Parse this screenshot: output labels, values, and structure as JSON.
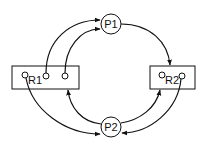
{
  "diagram": {
    "type": "resource-allocation-graph",
    "processes": [
      {
        "id": "P1",
        "label": "P1",
        "cx": 111,
        "cy": 24,
        "r": 10
      },
      {
        "id": "P2",
        "label": "P2",
        "cx": 111,
        "cy": 127,
        "r": 10
      }
    ],
    "resources": [
      {
        "id": "R1",
        "label": "R1",
        "x": 12,
        "y": 66,
        "w": 67,
        "h": 23,
        "instances": 3
      },
      {
        "id": "R2",
        "label": "R2",
        "x": 150,
        "y": 66,
        "w": 45,
        "h": 23,
        "instances": 2
      }
    ],
    "edges": [
      {
        "from": "R1.instance2",
        "to": "P1",
        "kind": "assignment"
      },
      {
        "from": "R1.instance3",
        "to": "P1",
        "kind": "assignment"
      },
      {
        "from": "P1",
        "to": "R2",
        "kind": "request"
      },
      {
        "from": "R1.instance1",
        "to": "P2",
        "kind": "assignment"
      },
      {
        "from": "P2",
        "to": "R1",
        "kind": "request"
      },
      {
        "from": "P2",
        "to": "R2",
        "kind": "request"
      },
      {
        "from": "R2.instance2",
        "to": "P2",
        "kind": "assignment"
      }
    ],
    "colors": {
      "stroke": "#111111",
      "background": "#ffffff"
    }
  }
}
